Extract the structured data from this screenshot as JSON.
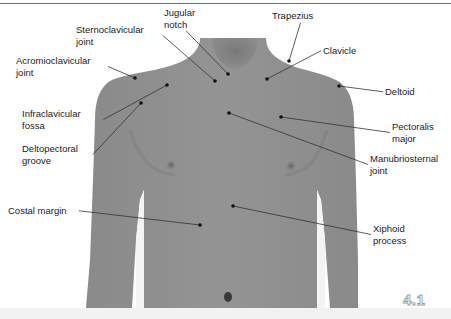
{
  "figure": {
    "number": "4.1",
    "colors": {
      "skin": "#8f8f8f",
      "skin_shadow": "#7a7a7a",
      "background": "#ffffff",
      "label_text": "#1c1c1c",
      "leader_line": "#333333",
      "rule": "#6f6f6f"
    }
  },
  "labels": [
    {
      "id": "jugular-notch",
      "text": "Jugular\nnotch",
      "x": 164,
      "y": 7,
      "dot": [
        228,
        74
      ]
    },
    {
      "id": "trapezius",
      "text": "Trapezius",
      "x": 272,
      "y": 10,
      "dot": [
        289,
        61
      ]
    },
    {
      "id": "sternoclavicular-joint",
      "text": "Sternoclavicular\njoint",
      "x": 76,
      "y": 24,
      "dot": [
        215,
        81
      ]
    },
    {
      "id": "clavicle",
      "text": "Clavicle",
      "x": 323,
      "y": 45,
      "dot": [
        267,
        79
      ]
    },
    {
      "id": "acromioclavicular-joint",
      "text": "Acromioclavicular\njoint",
      "x": 16,
      "y": 55,
      "dot": [
        135,
        78
      ]
    },
    {
      "id": "deltoid",
      "text": "Deltoid",
      "x": 385,
      "y": 86,
      "dot": [
        339,
        86
      ]
    },
    {
      "id": "infraclavicular-fossa",
      "text": "Infraclavicular\nfossa",
      "x": 22,
      "y": 108,
      "dot": [
        167,
        85
      ]
    },
    {
      "id": "pectoralis-major",
      "text": "Pectoralis\nmajor",
      "x": 392,
      "y": 121,
      "dot": [
        281,
        117
      ]
    },
    {
      "id": "deltopectoral-groove",
      "text": "Deltopectoral\ngroove",
      "x": 22,
      "y": 143,
      "dot": [
        141,
        103
      ]
    },
    {
      "id": "manubriosternal-joint",
      "text": "Manubriosternal\njoint",
      "x": 370,
      "y": 153,
      "dot": [
        229,
        113
      ]
    },
    {
      "id": "costal-margin",
      "text": "Costal margin",
      "x": 8,
      "y": 205,
      "dot": [
        200,
        225
      ]
    },
    {
      "id": "xiphoid-process",
      "text": "Xiphoid\nprocess",
      "x": 373,
      "y": 223,
      "dot": [
        233,
        206
      ]
    }
  ]
}
